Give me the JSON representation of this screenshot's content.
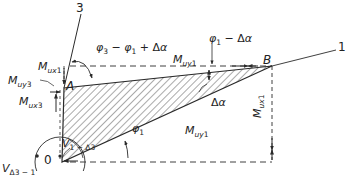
{
  "diagram": {
    "type": "geometric force/moment diagram",
    "points": {
      "O": "0",
      "A": "A",
      "B": "B"
    },
    "lines": {
      "line_3": "3",
      "line_1": "1"
    },
    "labels": {
      "angle_top_left": "φ3 − φ1 + Δα",
      "angle_top_right": "φ1 − Δα",
      "angle_bottom": "φ1",
      "angle_delta": "Δα",
      "M_ux1_top": "Mux1",
      "M_uy3": "Muy3",
      "M_ux3": "Mux3",
      "M_uy1_top": "Muy1",
      "M_uy1_bottom": "Muy1",
      "M_ux1_right": "Mux1",
      "V_1_d3": "V1−Δ3",
      "V_d3_1": "VΔ3−1"
    },
    "colors": {
      "stroke": "#2a2a2a",
      "background": "#ffffff"
    }
  }
}
